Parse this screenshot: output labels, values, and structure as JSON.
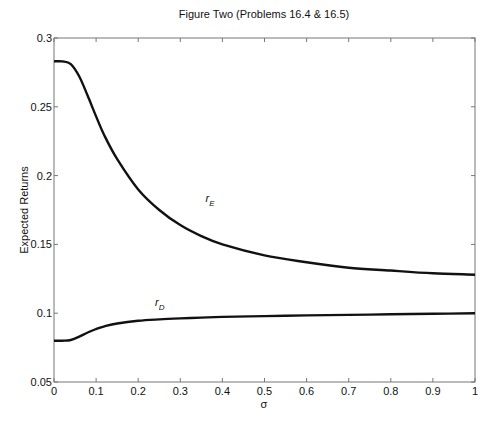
{
  "chart_data": {
    "type": "line",
    "title": "Figure Two (Problems 16.4 & 16.5)",
    "xlabel": "σ",
    "ylabel": "Expected Returns",
    "xlim": [
      0,
      1
    ],
    "ylim": [
      0.05,
      0.3
    ],
    "grid": false,
    "legend": "none (inline curve labels)",
    "xticks": [
      "0",
      "0.1",
      "0.2",
      "0.3",
      "0.4",
      "0.5",
      "0.6",
      "0.7",
      "0.8",
      "0.9",
      "1"
    ],
    "yticks": [
      "0.05",
      "0.1",
      "0.15",
      "0.2",
      "0.25",
      "0.3"
    ],
    "x": [
      0,
      0.02,
      0.04,
      0.06,
      0.08,
      0.1,
      0.12,
      0.15,
      0.2,
      0.25,
      0.3,
      0.35,
      0.4,
      0.5,
      0.6,
      0.7,
      0.8,
      0.9,
      1.0
    ],
    "series": [
      {
        "name": "r_E",
        "label": "r",
        "subscript": "E",
        "values": [
          0.283,
          0.283,
          0.281,
          0.272,
          0.258,
          0.243,
          0.229,
          0.212,
          0.19,
          0.175,
          0.164,
          0.156,
          0.15,
          0.142,
          0.137,
          0.133,
          0.131,
          0.129,
          0.128
        ]
      },
      {
        "name": "r_D",
        "label": "r",
        "subscript": "D",
        "values": [
          0.08,
          0.08,
          0.0805,
          0.083,
          0.086,
          0.0885,
          0.0905,
          0.0925,
          0.0945,
          0.0955,
          0.0962,
          0.0968,
          0.0973,
          0.0979,
          0.0984,
          0.0988,
          0.0992,
          0.0996,
          0.1
        ]
      }
    ],
    "annotations": [
      {
        "text": "r_E",
        "x": 0.36,
        "y": 0.181
      },
      {
        "text": "r_D",
        "x": 0.24,
        "y": 0.105
      }
    ]
  }
}
